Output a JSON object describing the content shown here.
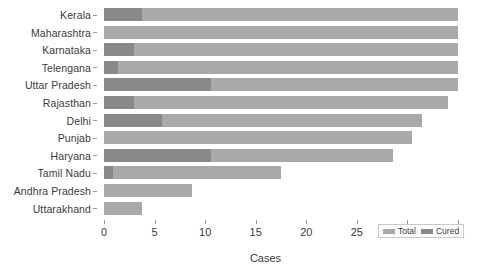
{
  "chart_data": {
    "type": "bar",
    "orientation": "horizontal",
    "stacked_overlay": true,
    "title": "",
    "xlabel": "Cases",
    "ylabel": "",
    "xlim": [
      0,
      35
    ],
    "xticks": [
      0,
      5,
      10,
      15,
      20,
      25,
      30,
      35
    ],
    "xtick_labels": [
      "0",
      "5",
      "10",
      "15",
      "20",
      "25",
      "30",
      "35"
    ],
    "grid": false,
    "legend_position": "bottom-right",
    "categories": [
      "Kerala",
      "Maharashtra",
      "Karnataka",
      "Telengana",
      "Uttar Pradesh",
      "Rajasthan",
      "Delhi",
      "Punjab",
      "Haryana",
      "Tamil Nadu",
      "Andhra Pradesh",
      "Uttarakhand"
    ],
    "series": [
      {
        "name": "Total",
        "color": "#a9a9a9",
        "values": [
          35,
          35,
          35,
          35,
          35,
          34,
          31.4,
          30.5,
          28.6,
          17.5,
          8.7,
          3.8
        ]
      },
      {
        "name": "Cured",
        "color": "#898989",
        "values": [
          3.8,
          0,
          3.0,
          1.4,
          10.6,
          3.0,
          5.7,
          0,
          10.6,
          0.9,
          0,
          0
        ]
      }
    ]
  },
  "legend": {
    "entries": [
      {
        "label": "Total",
        "swatch": "total-swatch"
      },
      {
        "label": "Cured",
        "swatch": "cured-swatch"
      }
    ]
  },
  "axis": {
    "x_title": "Cases"
  }
}
